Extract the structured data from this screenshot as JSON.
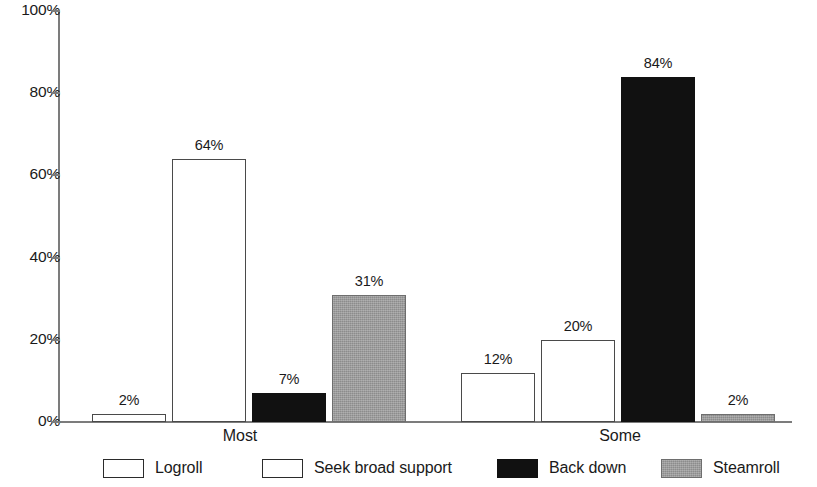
{
  "chart_data": {
    "type": "bar",
    "title": "",
    "subtitle": "",
    "xlabel": "",
    "ylabel": "",
    "categories": [
      "Most",
      "Some"
    ],
    "series": [
      {
        "name": "Logroll",
        "fill": "white",
        "values": [
          2,
          12
        ],
        "labels": [
          "2%",
          "12%"
        ]
      },
      {
        "name": "Seek broad support",
        "fill": "white",
        "values": [
          64,
          20
        ],
        "labels": [
          "64%",
          "20%"
        ]
      },
      {
        "name": "Back down",
        "fill": "black",
        "values": [
          7,
          84
        ],
        "labels": [
          "7%",
          "84%"
        ]
      },
      {
        "name": "Steamroll",
        "fill": "gray",
        "values": [
          31,
          2
        ],
        "labels": [
          "31%",
          "2%"
        ]
      }
    ],
    "ylim": [
      0,
      100
    ],
    "y_ticks": [
      0,
      20,
      40,
      60,
      80,
      100
    ],
    "y_tick_labels": [
      "0%",
      "20%",
      "40%",
      "60%",
      "80%",
      "100%"
    ],
    "grid": false,
    "legend_position": "bottom",
    "value_labels_shown": true,
    "colors": {
      "white_fill": "#ffffff",
      "white_border": "#4a4a4a",
      "black_fill": "#111111",
      "gray_fill": "#9a9a9a",
      "axis": "#7c7c7c",
      "text": "#1a1a1a"
    }
  },
  "axis": {
    "y_tick_labels": [
      "100%",
      "80%",
      "60%",
      "40%",
      "20%",
      "0%"
    ]
  },
  "legend": {
    "items": [
      {
        "label": "Logroll"
      },
      {
        "label": "Seek broad support"
      },
      {
        "label": "Back down"
      },
      {
        "label": "Steamroll"
      }
    ]
  }
}
